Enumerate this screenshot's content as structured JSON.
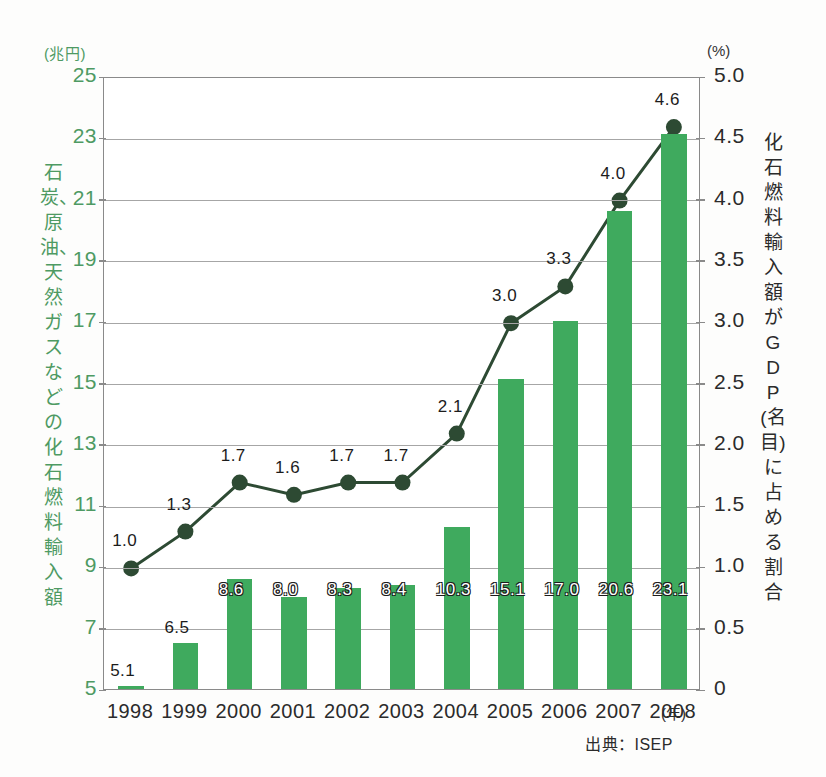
{
  "chart_data": {
    "type": "bar",
    "title": "",
    "subtitle": "",
    "categories": [
      "1998",
      "1999",
      "2000",
      "2001",
      "2002",
      "2003",
      "2004",
      "2005",
      "2006",
      "2007",
      "2008"
    ],
    "series": [
      {
        "name": "石炭、原油、天然ガスなどの化石燃料輸入額",
        "kind": "bar",
        "unit": "兆円",
        "axis": "left",
        "color": "#3faa5e",
        "values": [
          5.1,
          6.5,
          8.6,
          8.0,
          8.3,
          8.4,
          10.3,
          15.1,
          17.0,
          20.6,
          23.1
        ],
        "labels": [
          "5.1",
          "6.5",
          "8.6",
          "8.0",
          "8.3",
          "8.4",
          "10.3",
          "15.1",
          "17.0",
          "20.6",
          "23.1"
        ]
      },
      {
        "name": "化石燃料輸入額がGDP(名目)に占める割合",
        "kind": "line",
        "unit": "%",
        "axis": "right",
        "color": "#2d4a33",
        "values": [
          1.0,
          1.3,
          1.7,
          1.6,
          1.7,
          1.7,
          2.1,
          3.0,
          3.3,
          4.0,
          4.6
        ],
        "labels": [
          "1.0",
          "1.3",
          "1.7",
          "1.6",
          "1.7",
          "1.7",
          "2.1",
          "3.0",
          "3.3",
          "4.0",
          "4.6"
        ]
      }
    ],
    "left_axis": {
      "unit_label": "(兆円)",
      "title": "石炭、原油、天然ガスなどの化石燃料輸入額",
      "ticks": [
        "25",
        "23",
        "21",
        "19",
        "17",
        "15",
        "13",
        "11",
        "9",
        "7",
        "5"
      ],
      "tick_values": [
        25,
        23,
        21,
        19,
        17,
        15,
        13,
        11,
        9,
        7,
        5
      ],
      "ylim": [
        5,
        25
      ]
    },
    "right_axis": {
      "unit_label": "(%)",
      "title": "化石燃料輸入額がGDP(名目)に占める割合",
      "ticks": [
        "5.0",
        "4.5",
        "4.0",
        "3.5",
        "3.0",
        "2.5",
        "2.0",
        "1.5",
        "1.0",
        "0.5",
        "0"
      ],
      "tick_values": [
        5.0,
        4.5,
        4.0,
        3.5,
        3.0,
        2.5,
        2.0,
        1.5,
        1.0,
        0.5,
        0
      ],
      "ylim": [
        0,
        5
      ]
    },
    "xlabel": "(年)",
    "grid": true,
    "legend": "none"
  },
  "footer": {
    "source": "出典：ISEP"
  }
}
